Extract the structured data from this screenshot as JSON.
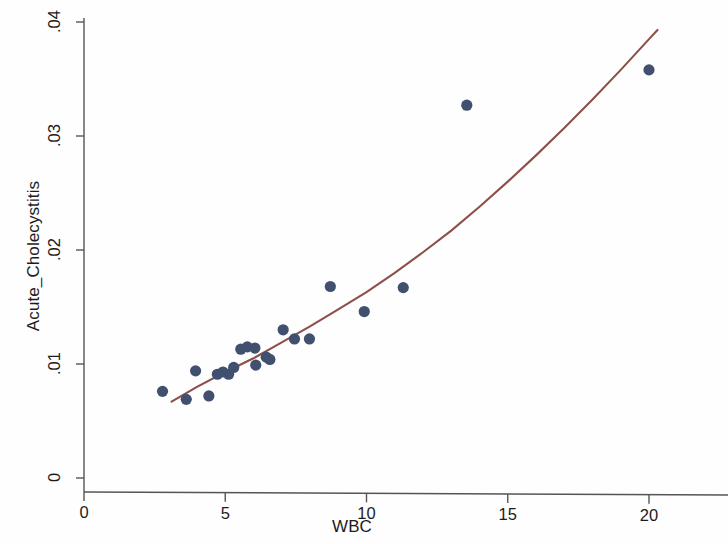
{
  "chart_data": {
    "type": "scatter",
    "title": "",
    "subtitle": "",
    "xlabel": "WBC",
    "ylabel": "Acute_Cholecystitis",
    "xlim": [
      0,
      20
    ],
    "ylim": [
      0,
      0.04
    ],
    "xticks": [
      "0",
      "5",
      "10",
      "15",
      "20"
    ],
    "xtick_values": [
      0,
      5,
      10,
      15,
      20
    ],
    "yticks": [
      "0",
      ".01",
      ".02",
      ".03",
      ".04"
    ],
    "ytick_values": [
      0,
      0.01,
      0.02,
      0.03,
      0.04
    ],
    "grid": false,
    "legend": null,
    "marker_color": "#40506e",
    "line_color": "#8d5049",
    "axis_color": "#555555",
    "background_color": "#ffffff",
    "series": [
      {
        "name": "observations",
        "type": "scatter",
        "marker": "filled-circle",
        "color": "#40506e",
        "points": [
          [
            2.78,
            0.0076
          ],
          [
            3.62,
            0.0069
          ],
          [
            3.95,
            0.0094
          ],
          [
            4.42,
            0.0072
          ],
          [
            4.72,
            0.0091
          ],
          [
            4.92,
            0.0093
          ],
          [
            5.12,
            0.0091
          ],
          [
            5.3,
            0.0097
          ],
          [
            5.55,
            0.0113
          ],
          [
            5.78,
            0.0115
          ],
          [
            6.05,
            0.0114
          ],
          [
            6.08,
            0.0099
          ],
          [
            6.45,
            0.0106
          ],
          [
            6.58,
            0.0104
          ],
          [
            7.05,
            0.013
          ],
          [
            7.45,
            0.0122
          ],
          [
            7.98,
            0.0122
          ],
          [
            8.72,
            0.0168
          ],
          [
            9.92,
            0.0146
          ],
          [
            11.3,
            0.0167
          ],
          [
            13.55,
            0.0327
          ],
          [
            20.0,
            0.0358
          ]
        ]
      },
      {
        "name": "fitted-curve",
        "type": "line",
        "color": "#8d5049",
        "points": [
          [
            3.1,
            0.0067
          ],
          [
            4.0,
            0.008
          ],
          [
            5.0,
            0.0093
          ],
          [
            6.0,
            0.0105
          ],
          [
            7.0,
            0.0119
          ],
          [
            8.0,
            0.0133
          ],
          [
            9.0,
            0.0148
          ],
          [
            10.0,
            0.0163
          ],
          [
            11.0,
            0.018
          ],
          [
            12.0,
            0.0198
          ],
          [
            13.0,
            0.0217
          ],
          [
            14.0,
            0.0238
          ],
          [
            15.0,
            0.026
          ],
          [
            16.0,
            0.0283
          ],
          [
            17.0,
            0.0307
          ],
          [
            18.0,
            0.0332
          ],
          [
            19.0,
            0.0358
          ],
          [
            20.0,
            0.0385
          ],
          [
            20.3,
            0.0393
          ]
        ]
      }
    ]
  }
}
